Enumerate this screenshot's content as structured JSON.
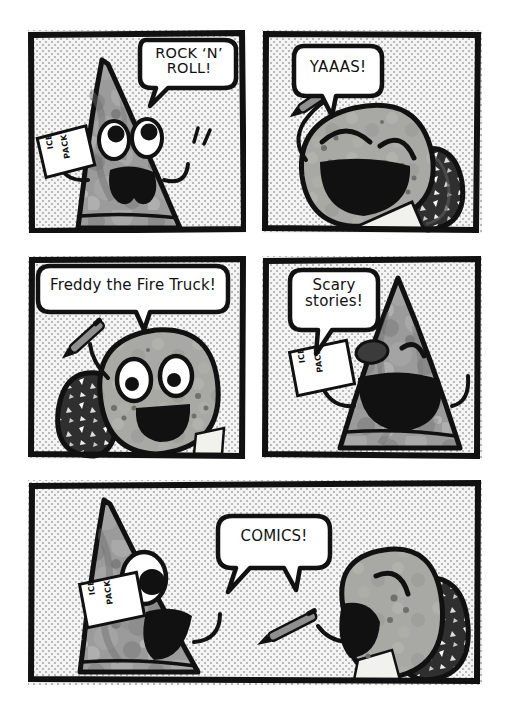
{
  "comic": {
    "background_color": "#ffffff",
    "ink_color": "#111111",
    "halftone_color": "#b9b9b9",
    "panels": [
      {
        "id": "panel-1",
        "speech": "ROCK ‘N’\nROLL!",
        "prop_label_line1": "ICE",
        "prop_label_line2": "PACK",
        "character": "rock-triangle"
      },
      {
        "id": "panel-2",
        "speech": "YAAAS!",
        "character": "geode-blob"
      },
      {
        "id": "panel-3",
        "speech": "Freddy the Fire Truck!",
        "character": "geode-blob"
      },
      {
        "id": "panel-4",
        "speech": "Scary\nstories!",
        "prop_label_line1": "ICE",
        "prop_label_line2": "PACK",
        "character": "rock-triangle"
      },
      {
        "id": "panel-5",
        "speech": "COMICS!",
        "prop_label_line1": "ICE",
        "prop_label_line2": "PACK",
        "character": "rock-triangle-and-geode-blob"
      }
    ]
  }
}
